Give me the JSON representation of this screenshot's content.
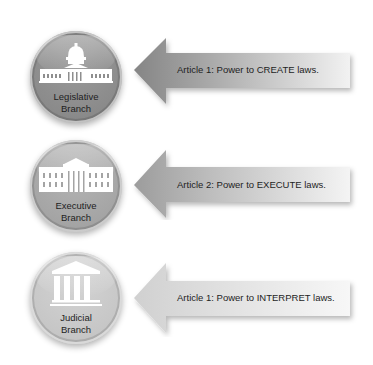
{
  "diagram": {
    "rows": [
      {
        "branch": {
          "line1": "Legislative",
          "line2": "Branch",
          "icon": "capitol-building-icon",
          "fill": "#8e8e8e",
          "ring": "#7a7a7a"
        },
        "arrow": {
          "text": "Article 1:  Power to CREATE laws.",
          "fill_dark": "#858585",
          "fill_light": "#f2f2f2"
        }
      },
      {
        "branch": {
          "line1": "Executive",
          "line2": "Branch",
          "icon": "white-house-icon",
          "fill": "#a6a6a6",
          "ring": "#939393"
        },
        "arrow": {
          "text": "Article 2:  Power to EXECUTE laws.",
          "fill_dark": "#9c9c9c",
          "fill_light": "#f4f4f4"
        }
      },
      {
        "branch": {
          "line1": "Judicial",
          "line2": "Branch",
          "icon": "courthouse-columns-icon",
          "fill": "#c8c8c8",
          "ring": "#bdbdbd"
        },
        "arrow": {
          "text": "Article 1:  Power to INTERPRET laws.",
          "fill_dark": "#cfcfcf",
          "fill_light": "#f7f7f7"
        }
      }
    ]
  }
}
